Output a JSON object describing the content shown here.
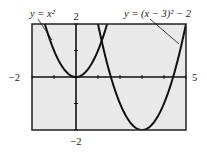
{
  "chart_data": {
    "type": "line",
    "title": "",
    "xlabel": "",
    "ylabel": "",
    "xlim": [
      -2,
      5
    ],
    "ylim": [
      -2,
      2
    ],
    "x_tick_step": 1,
    "y_tick_step": 1,
    "grid": false,
    "window_labels": {
      "xmin": "−2",
      "xmax": "5",
      "ymin": "−2",
      "ymax": "2"
    },
    "series": [
      {
        "name": "y = x^2",
        "label_text": "y = x²",
        "equation": "x^2",
        "vertex": [
          0,
          0
        ]
      },
      {
        "name": "y = (x − 3)^2 − 2",
        "label_text": "y = (x − 3)² − 2",
        "equation": "(x-3)^2-2",
        "vertex": [
          3,
          -2
        ]
      }
    ],
    "annotations": [
      {
        "text": "y = x²",
        "points_to_series": 0
      },
      {
        "text": "y = (x − 3)² − 2",
        "points_to_series": 1
      }
    ]
  },
  "colors": {
    "plot_background": "#e9e9e9",
    "curve": "#111111",
    "frame": "#222222"
  }
}
